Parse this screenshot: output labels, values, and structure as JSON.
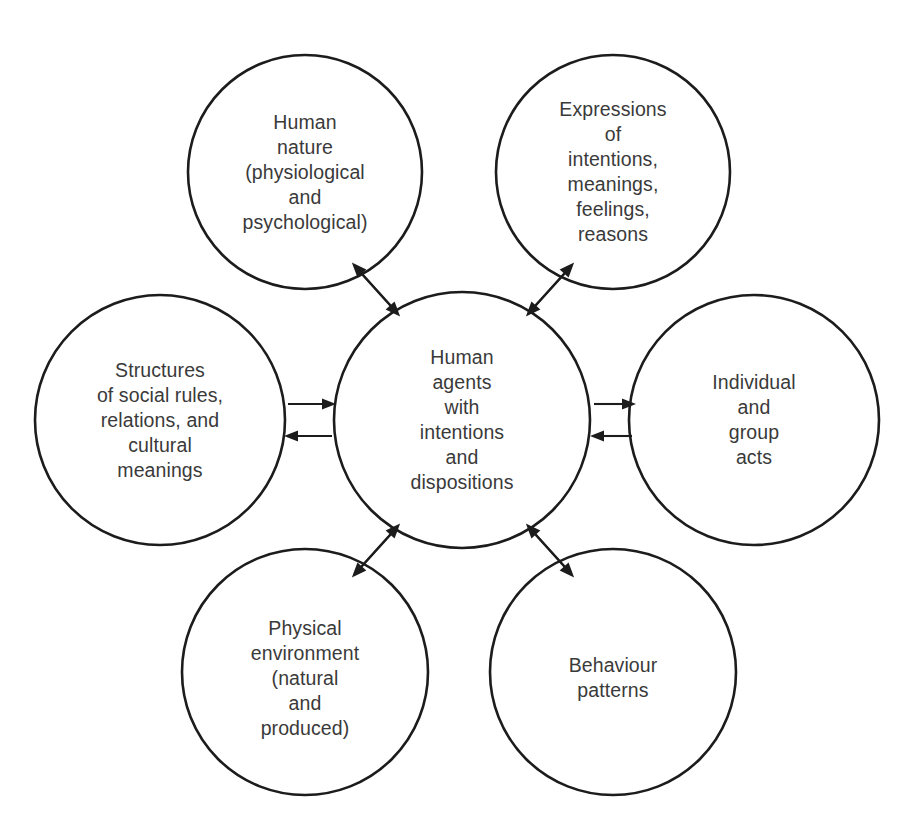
{
  "diagram": {
    "type": "hub-and-spoke circle diagram",
    "background_color": "#ffffff",
    "stroke_color": "#1c1c1c",
    "text_color": "#3a3a3a",
    "canvas": {
      "width": 903,
      "height": 824
    },
    "central_node": {
      "id": "human-agents",
      "label": "Human\nagents\nwith\nintentions\nand\ndispositions",
      "lines": [
        "Human",
        "agents",
        "with",
        "intentions",
        "and",
        "dispositions"
      ],
      "cx": 462,
      "cy": 420,
      "r": 128
    },
    "outer_nodes": [
      {
        "id": "human-nature",
        "position": "top-left",
        "label": "Human\nnature\n(physiological\nand\npsychological)",
        "lines": [
          "Human",
          "nature",
          "(physiological",
          "and",
          "psychological)"
        ],
        "cx": 305,
        "cy": 172,
        "r": 117
      },
      {
        "id": "expressions",
        "position": "top-right",
        "label": "Expressions\nof\nintentions,\nmeanings,\nfeelings,\nreasons",
        "lines": [
          "Expressions",
          "of",
          "intentions,",
          "meanings,",
          "feelings,",
          "reasons"
        ],
        "cx": 613,
        "cy": 172,
        "r": 117
      },
      {
        "id": "structures",
        "position": "left",
        "label": "Structures\nof social rules,\nrelations, and\ncultural\nmeanings",
        "lines": [
          "Structures",
          "of social rules,",
          "relations, and",
          "cultural",
          "meanings"
        ],
        "cx": 160,
        "cy": 420,
        "r": 125
      },
      {
        "id": "individual-group-acts",
        "position": "right",
        "label": "Individual\nand\ngroup\nacts",
        "lines": [
          "Individual",
          "and",
          "group",
          "acts"
        ],
        "cx": 754,
        "cy": 420,
        "r": 125
      },
      {
        "id": "physical-environment",
        "position": "bottom-left",
        "label": "Physical\nenvironment\n(natural\nand\nproduced)",
        "lines": [
          "Physical",
          "environment",
          "(natural",
          "and",
          "produced)"
        ],
        "cx": 305,
        "cy": 672,
        "r": 123
      },
      {
        "id": "behaviour-patterns",
        "position": "bottom-right",
        "label": "Behaviour\npatterns",
        "lines": [
          "Behaviour",
          "patterns"
        ],
        "cx": 613,
        "cy": 672,
        "r": 123
      }
    ],
    "connections": [
      {
        "id": "conn-human-nature",
        "between": [
          "human-agents",
          "human-nature"
        ],
        "direction": "bidirectional",
        "style": "two parallel diagonal arrows",
        "orientation": "diagonal-up-left"
      },
      {
        "id": "conn-expressions",
        "between": [
          "human-agents",
          "expressions"
        ],
        "direction": "bidirectional",
        "style": "two parallel diagonal arrows",
        "orientation": "diagonal-up-right"
      },
      {
        "id": "conn-structures",
        "between": [
          "human-agents",
          "structures"
        ],
        "direction": "bidirectional",
        "style": "two parallel horizontal arrows",
        "orientation": "horizontal-left"
      },
      {
        "id": "conn-individual-group-acts",
        "between": [
          "human-agents",
          "individual-group-acts"
        ],
        "direction": "bidirectional",
        "style": "two parallel horizontal arrows",
        "orientation": "horizontal-right"
      },
      {
        "id": "conn-physical-environment",
        "between": [
          "human-agents",
          "physical-environment"
        ],
        "direction": "bidirectional",
        "style": "two parallel diagonal arrows",
        "orientation": "diagonal-down-left"
      },
      {
        "id": "conn-behaviour-patterns",
        "between": [
          "human-agents",
          "behaviour-patterns"
        ],
        "direction": "bidirectional",
        "style": "two parallel diagonal arrows",
        "orientation": "diagonal-down-right"
      }
    ]
  }
}
